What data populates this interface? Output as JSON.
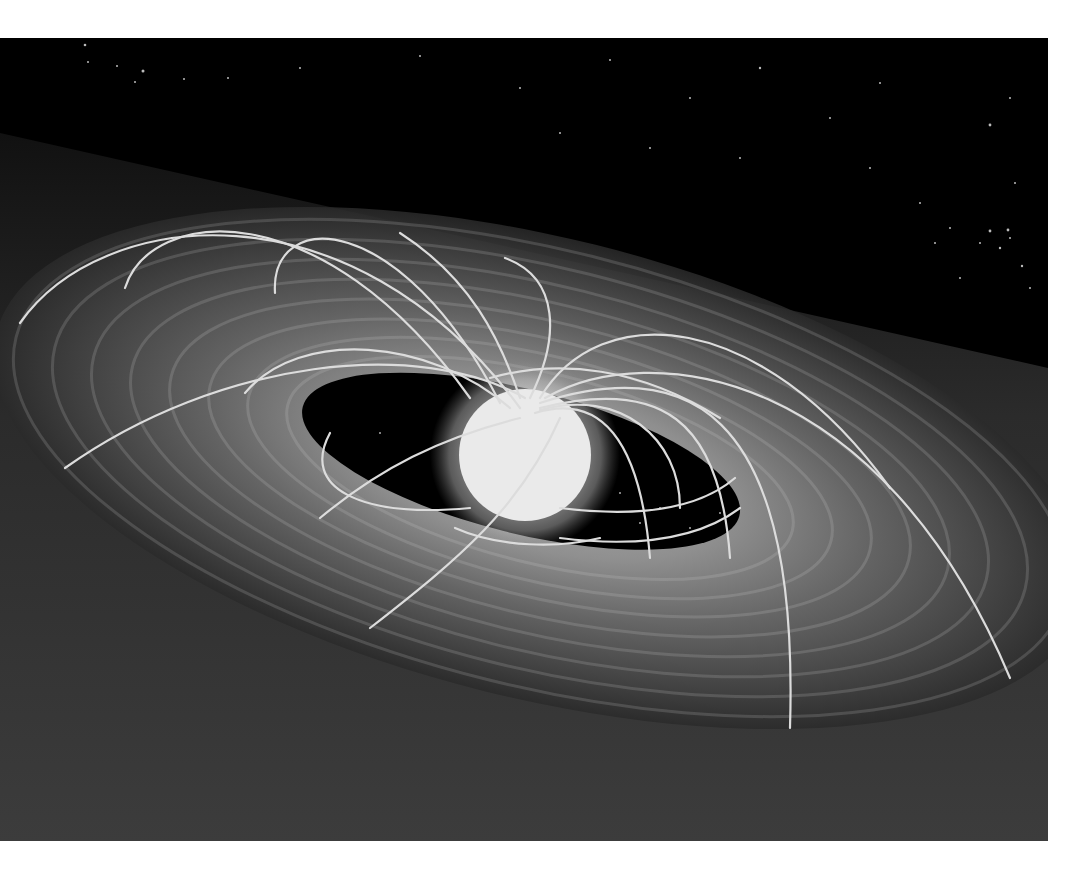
{
  "image": {
    "subject": "artist illustration of a young star with magnetic field lines and an accretion disk",
    "style": "grayscale",
    "background_color": "#ffffff",
    "frame": {
      "x": 0,
      "y": 38,
      "width": 1048,
      "height": 803
    },
    "colors": {
      "space": "#000000",
      "disk_dark": "#2a2a2a",
      "disk_mid": "#5a5a5a",
      "disk_bright": "#b5b5b5",
      "star_core": "#ffffff",
      "field_line": "#d9d9d9"
    },
    "elements": {
      "star": {
        "cx": 525,
        "cy": 417,
        "r": 68
      },
      "inner_hole": {
        "cx": 520,
        "cy": 428,
        "rx": 225,
        "ry": 72,
        "rotate": 14
      },
      "disk": {
        "cx": 540,
        "cy": 430,
        "rx": 560,
        "ry": 250,
        "rotate": 14
      }
    }
  }
}
